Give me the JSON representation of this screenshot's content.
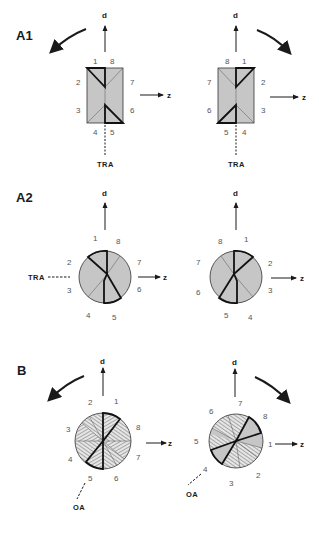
{
  "figure": {
    "panels": [
      {
        "id": "A1",
        "label": "A1",
        "shape": "rectangle",
        "axis_d": "d",
        "axis_z": "z",
        "marker": "TRA",
        "left": {
          "rotation_arrow": "counterclockwise",
          "numbers": {
            "n1": "1",
            "n2": "2",
            "n3": "3",
            "n4": "4",
            "n5": "5",
            "n6": "6",
            "n7": "7",
            "n8": "8"
          }
        },
        "right": {
          "rotation_arrow": "clockwise",
          "numbers": {
            "n1": "1",
            "n2": "2",
            "n3": "3",
            "n4": "4",
            "n5": "5",
            "n6": "6",
            "n7": "7",
            "n8": "8"
          }
        }
      },
      {
        "id": "A2",
        "label": "A2",
        "shape": "circle",
        "axis_d": "d",
        "axis_z": "z",
        "marker": "TRA"
      },
      {
        "id": "B",
        "label": "B",
        "shape": "circle",
        "axis_d": "d",
        "axis_z": "z",
        "marker": "OA"
      }
    ]
  }
}
